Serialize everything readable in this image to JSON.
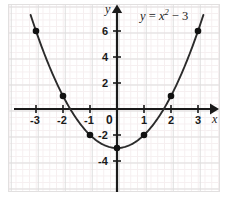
{
  "figure": {
    "name": "parabola-graph",
    "equation_label": {
      "lhs": "y",
      "eq": "=",
      "base": "x",
      "exp": "2",
      "minus": "− 3"
    },
    "axis_names": {
      "x": "x",
      "y": "y"
    }
  },
  "colors": {
    "background": "#ffffff",
    "panel_border": "#e2e0e0",
    "grid_minor": "#f6eff0",
    "grid_major": "#dedddd",
    "axis": "#1a1a1a",
    "curve": "#2b2b2b",
    "point": "#111111",
    "text": "#1a1a1a"
  },
  "chart_data": {
    "type": "line",
    "xlabel": "x",
    "ylabel": "y",
    "xlim": [
      -3.9,
      3.9
    ],
    "ylim": [
      -6.0,
      7.6
    ],
    "grid": true,
    "legend": "none",
    "equation": "y = x^2 - 3",
    "x": [
      -3,
      -2,
      -1,
      0,
      1,
      2,
      3
    ],
    "values": [
      6,
      1,
      -2,
      -3,
      -2,
      1,
      6
    ],
    "marked_points": [
      {
        "x": -3,
        "y": 6
      },
      {
        "x": -2,
        "y": 1
      },
      {
        "x": -1,
        "y": -2
      },
      {
        "x": 0,
        "y": -3
      },
      {
        "x": 1,
        "y": -2
      },
      {
        "x": 2,
        "y": 1
      },
      {
        "x": 3,
        "y": 6
      }
    ],
    "xticks": [
      {
        "value": -3,
        "label": "-3"
      },
      {
        "value": -2,
        "label": "-2"
      },
      {
        "value": -1,
        "label": "-1"
      },
      {
        "value": 0,
        "label": "0"
      },
      {
        "value": 1,
        "label": "1"
      },
      {
        "value": 2,
        "label": "2"
      },
      {
        "value": 3,
        "label": "3"
      }
    ],
    "yticks": [
      {
        "value": 6,
        "label": "6"
      },
      {
        "value": 4,
        "label": "4"
      },
      {
        "value": 2,
        "label": "2"
      },
      {
        "value": -2,
        "label": "-2"
      },
      {
        "value": -4,
        "label": "-4"
      }
    ],
    "origin_label": "0"
  }
}
